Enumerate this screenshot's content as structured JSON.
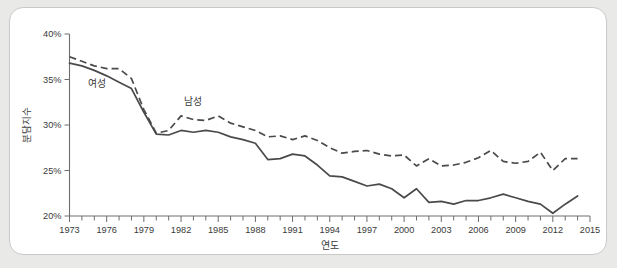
{
  "chart_data": {
    "type": "line",
    "title": "",
    "subtitle": "",
    "xlabel": "연도",
    "ylabel": "분담지수",
    "xlim": [
      1973,
      2015
    ],
    "ylim": [
      20,
      40
    ],
    "grid": false,
    "legend_position": "inline-annotation",
    "y_tick_labels": [
      "40%",
      "35%",
      "30%",
      "25%",
      "20%"
    ],
    "y_tick_values": [
      40,
      35,
      30,
      25,
      20
    ],
    "x_tick_labels": [
      "1973",
      "1976",
      "1979",
      "1982",
      "1985",
      "1988",
      "1991",
      "1994",
      "1997",
      "2000",
      "2003",
      "2006",
      "2009",
      "2012",
      "2015"
    ],
    "x_tick_values": [
      1973,
      1976,
      1979,
      1982,
      1985,
      1988,
      1991,
      1994,
      1997,
      2000,
      2003,
      2006,
      2009,
      2012,
      2015
    ],
    "x_minor_ticks_every": 1,
    "x": [
      1973,
      1974,
      1975,
      1976,
      1977,
      1978,
      1979,
      1980,
      1981,
      1982,
      1983,
      1984,
      1985,
      1986,
      1987,
      1988,
      1989,
      1990,
      1991,
      1992,
      1993,
      1994,
      1995,
      1996,
      1997,
      1998,
      1999,
      2000,
      2001,
      2002,
      2003,
      2004,
      2005,
      2006,
      2007,
      2008,
      2009,
      2010,
      2011,
      2012,
      2013,
      2014
    ],
    "series": [
      {
        "name": "여성",
        "style": "solid",
        "color": "#4a4a4a",
        "label_x": 1975.2,
        "label_y": 34.2,
        "values": [
          36.8,
          36.5,
          36.0,
          35.4,
          34.7,
          34.0,
          31.4,
          29.0,
          28.9,
          29.4,
          29.2,
          29.4,
          29.2,
          28.7,
          28.4,
          28.0,
          26.2,
          26.3,
          26.8,
          26.6,
          25.6,
          24.4,
          24.3,
          23.8,
          23.3,
          23.5,
          23.0,
          22.0,
          23.0,
          21.5,
          21.6,
          21.3,
          21.7,
          21.7,
          22.0,
          22.4,
          22.0,
          21.6,
          21.3,
          20.3,
          21.3,
          22.2
        ]
      },
      {
        "name": "남성",
        "style": "dashed",
        "color": "#4a4a4a",
        "label_x": 1983.0,
        "label_y": 32.2,
        "values": [
          37.5,
          37.0,
          36.5,
          36.2,
          36.2,
          35.1,
          31.7,
          29.1,
          29.4,
          31.0,
          30.6,
          30.5,
          31.0,
          30.2,
          29.8,
          29.4,
          28.7,
          28.8,
          28.4,
          28.8,
          28.3,
          27.5,
          26.9,
          27.1,
          27.2,
          26.8,
          26.6,
          26.7,
          25.5,
          26.3,
          25.5,
          25.6,
          25.9,
          26.4,
          27.2,
          26.0,
          25.8,
          26.0,
          27.0,
          25.0,
          26.3,
          26.3
        ]
      }
    ]
  },
  "annotations": {
    "female_label": "여성",
    "male_label": "남성"
  }
}
